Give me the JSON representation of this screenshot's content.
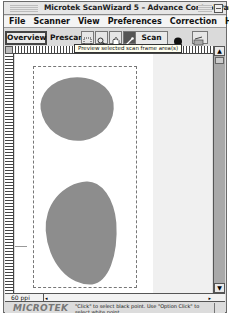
{
  "window": {
    "title": "Microtek ScanWizard 5 – Advance Control Panel"
  },
  "menubar": {
    "items": [
      "File",
      "Scanner",
      "View",
      "Preferences",
      "Correction",
      "Help"
    ]
  },
  "toolbar": {
    "overview_label": "Overview",
    "prescan_label": "Prescan",
    "scan_label": "Scan",
    "tools": [
      {
        "name": "frame-select-tool",
        "selected": false
      },
      {
        "name": "zoom-tool",
        "selected": false
      },
      {
        "name": "hand-tool",
        "selected": false
      },
      {
        "name": "eyedropper-tool",
        "selected": true
      }
    ]
  },
  "tooltip": {
    "text": "Preview selected scan frame area(s)"
  },
  "preview": {
    "frame_count": 1,
    "object_color": "#8d8d8d"
  },
  "statusbar": {
    "resolution": "60 ppi"
  },
  "footer": {
    "logo": "MICROTEK",
    "hint": "\"Click\" to select black point. Use \"Option Click\" to select white point."
  }
}
